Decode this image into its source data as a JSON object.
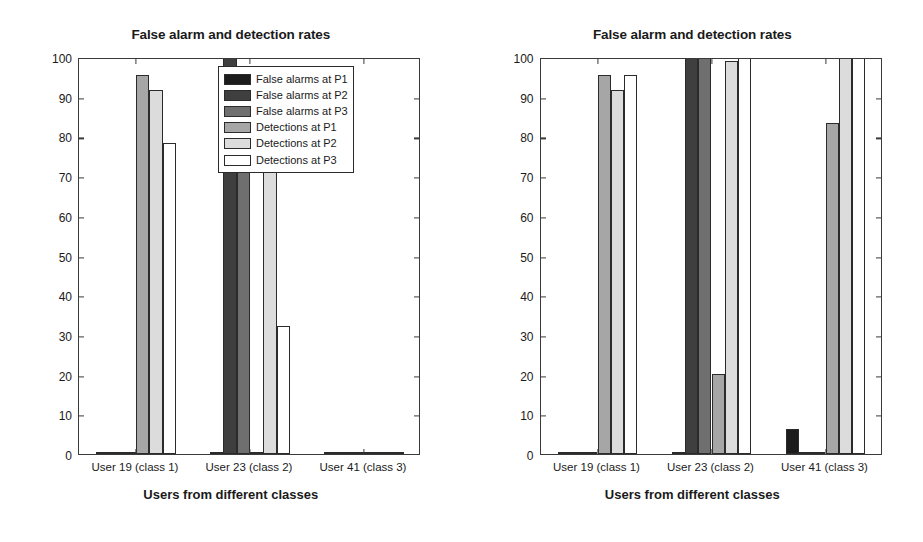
{
  "figure": {
    "background": "#ffffff",
    "panel_count": 2
  },
  "series_colors": {
    "false_alarms_p1": "#1c1c1c",
    "false_alarms_p2": "#3f3f3f",
    "false_alarms_p3": "#6f6f6f",
    "detections_p1": "#a6a6a6",
    "detections_p2": "#dcdcdc",
    "detections_p3": "#ffffff",
    "axis": "#3a3a3a",
    "text": "#1a1a1a"
  },
  "legend": {
    "position": "top-right-inside",
    "entries": [
      {
        "label": "False alarms at P1",
        "color": "#1c1c1c"
      },
      {
        "label": "False alarms at P2",
        "color": "#3f3f3f"
      },
      {
        "label": "False alarms at P3",
        "color": "#6f6f6f"
      },
      {
        "label": "Detections at P1",
        "color": "#a6a6a6"
      },
      {
        "label": "Detections at P2",
        "color": "#dcdcdc"
      },
      {
        "label": "Detections at P3",
        "color": "#ffffff"
      }
    ]
  },
  "chart_data": [
    {
      "panel": "left",
      "type": "bar",
      "title": "False alarm and detection rates",
      "xlabel": "Users from different classes",
      "ylabel": "Percentage of false alarms and detections",
      "categories": [
        "User 19 (class 1)",
        "User 23 (class 2)",
        "User 41 (class 3)"
      ],
      "ylim": [
        0,
        100
      ],
      "yticks": [
        0,
        10,
        20,
        30,
        40,
        50,
        60,
        70,
        80,
        90,
        100
      ],
      "grid": false,
      "legend_visible": true,
      "series": [
        {
          "name": "False alarms at P1",
          "color": "#1c1c1c",
          "values": [
            0,
            0,
            0
          ]
        },
        {
          "name": "False alarms at P2",
          "color": "#3f3f3f",
          "values": [
            0,
            100,
            0
          ]
        },
        {
          "name": "False alarms at P3",
          "color": "#6f6f6f",
          "values": [
            0,
            85.7,
            0
          ]
        },
        {
          "name": "Detections at P1",
          "color": "#a6a6a6",
          "values": [
            95.4,
            0,
            0
          ]
        },
        {
          "name": "Detections at P2",
          "color": "#dcdcdc",
          "values": [
            91.8,
            74.1,
            0
          ]
        },
        {
          "name": "Detections at P3",
          "color": "#ffffff",
          "values": [
            78.4,
            32.3,
            0
          ]
        }
      ]
    },
    {
      "panel": "right",
      "type": "bar",
      "title": "False alarm and detection rates",
      "xlabel": "Users from different classes",
      "ylabel": "Percentage of false alarms and detections",
      "categories": [
        "User 19 (class 1)",
        "User 23 (class 2)",
        "User 41 (class 3)"
      ],
      "ylim": [
        0,
        100
      ],
      "yticks": [
        0,
        10,
        20,
        30,
        40,
        50,
        60,
        70,
        80,
        90,
        100
      ],
      "grid": false,
      "legend_visible": false,
      "series": [
        {
          "name": "False alarms at P1",
          "color": "#1c1c1c",
          "values": [
            0,
            0,
            6.2
          ]
        },
        {
          "name": "False alarms at P2",
          "color": "#3f3f3f",
          "values": [
            0,
            100,
            0
          ]
        },
        {
          "name": "False alarms at P3",
          "color": "#6f6f6f",
          "values": [
            0,
            100,
            0
          ]
        },
        {
          "name": "Detections at P1",
          "color": "#a6a6a6",
          "values": [
            95.4,
            20.2,
            83.4
          ]
        },
        {
          "name": "Detections at P2",
          "color": "#dcdcdc",
          "values": [
            91.8,
            99.1,
            100
          ]
        },
        {
          "name": "Detections at P3",
          "color": "#ffffff",
          "values": [
            95.5,
            100,
            100
          ]
        }
      ]
    }
  ]
}
